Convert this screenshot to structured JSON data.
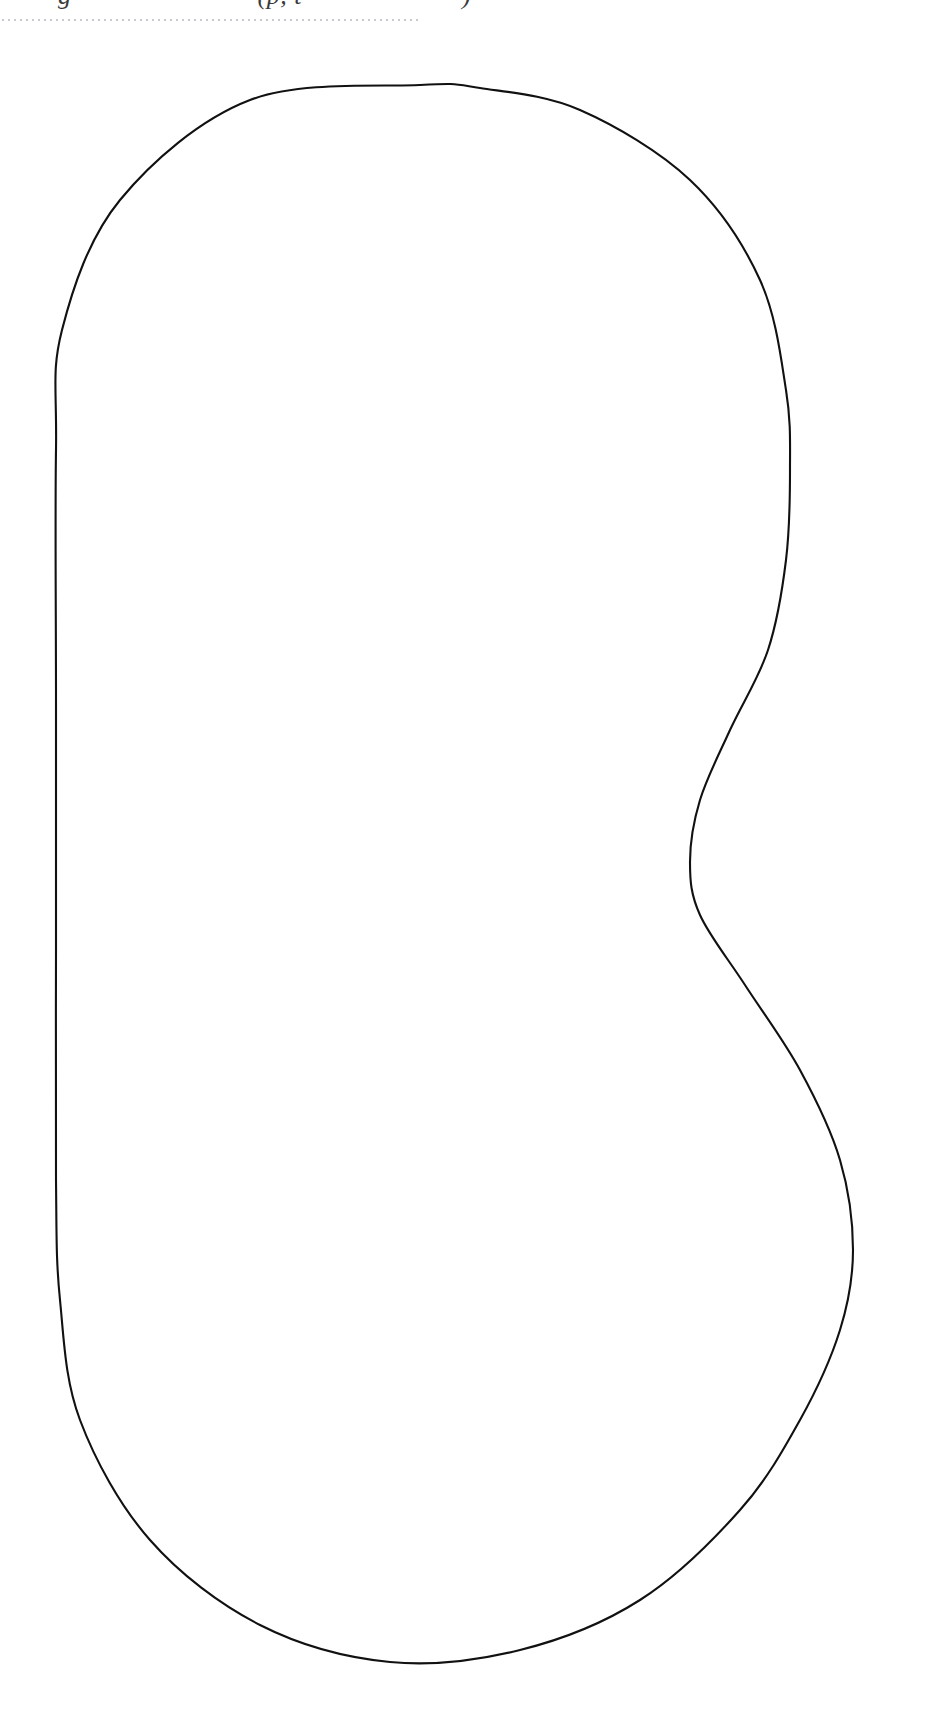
{
  "page": {
    "background_color": "#ffffff",
    "width": 929,
    "height": 1717
  },
  "header": {
    "running_text_visible_fragment": "g (p, t ) )",
    "note": "top line is cut off by the page crop; only glyph descenders are visible",
    "fragment_a": "g",
    "fragment_b": "(p, t",
    "fragment_c": ")",
    "rule_style": "dotted",
    "rule_color": "#c9c9cf",
    "rule_width_px": 421
  },
  "figure": {
    "caption": "",
    "stroke_color": "#111111",
    "fill_color": "#ffffff",
    "stroke_width": 2.1,
    "shape_name": "closed-region-outline"
  },
  "chart_data": {
    "type": "line",
    "title": "",
    "subtitle": "",
    "xlabel": "",
    "ylabel": "",
    "grid": false,
    "legend": null,
    "xlim": [
      0,
      929
    ],
    "ylim": [
      0,
      1717
    ],
    "closed": true,
    "series": [
      {
        "name": "region-boundary",
        "color": "#111111",
        "points": [
          [
            420,
            85
          ],
          [
            250,
            100
          ],
          [
            120,
            200
          ],
          [
            62,
            330
          ],
          [
            56,
            450
          ],
          [
            56,
            700
          ],
          [
            56,
            950
          ],
          [
            56,
            1180
          ],
          [
            60,
            1300
          ],
          [
            80,
            1420
          ],
          [
            150,
            1540
          ],
          [
            260,
            1625
          ],
          [
            390,
            1662
          ],
          [
            520,
            1650
          ],
          [
            640,
            1600
          ],
          [
            740,
            1510
          ],
          [
            800,
            1420
          ],
          [
            840,
            1330
          ],
          [
            853,
            1250
          ],
          [
            840,
            1160
          ],
          [
            800,
            1070
          ],
          [
            745,
            985
          ],
          [
            700,
            915
          ],
          [
            690,
            862
          ],
          [
            700,
            800
          ],
          [
            730,
            730
          ],
          [
            768,
            650
          ],
          [
            786,
            560
          ],
          [
            790,
            470
          ],
          [
            786,
            390
          ],
          [
            760,
            280
          ],
          [
            690,
            180
          ],
          [
            580,
            110
          ],
          [
            480,
            88
          ],
          [
            420,
            85
          ]
        ],
        "anchor_points": {
          "top_apex": [
            420,
            85
          ],
          "left_straight_top": [
            56,
            420
          ],
          "left_straight_bottom": [
            56,
            1270
          ],
          "bottom_apex": [
            390,
            1662
          ],
          "upper_right_max": [
            790,
            440
          ],
          "concave_notch_min": [
            690,
            862
          ],
          "lower_right_max": [
            853,
            1290
          ]
        }
      }
    ]
  }
}
